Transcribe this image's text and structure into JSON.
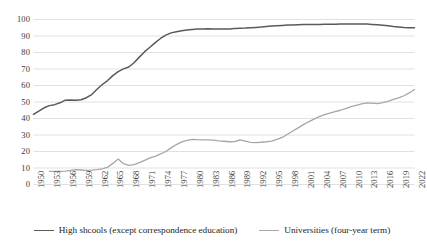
{
  "chart_data": {
    "type": "line",
    "title": "",
    "subtitle": "",
    "xlabel": "",
    "ylabel": "",
    "ylim": [
      0,
      100
    ],
    "ytick_step": 10,
    "yticks": [
      100,
      90,
      80,
      70,
      60,
      50,
      40,
      30,
      20,
      10,
      0
    ],
    "xlim": [
      1950,
      2022
    ],
    "grid": "horizontal",
    "legend_position": "bottom",
    "xtick_labels": [
      "1950",
      "1953",
      "1956",
      "1959",
      "1962",
      "1965",
      "1968",
      "1971",
      "1974",
      "1977",
      "1980",
      "1983",
      "1986",
      "1989",
      "1992",
      "1995",
      "1998",
      "2001",
      "2004",
      "2007",
      "2010",
      "2013",
      "2016",
      "2019",
      "2022"
    ],
    "x": [
      1950,
      1951,
      1952,
      1953,
      1954,
      1955,
      1956,
      1957,
      1958,
      1959,
      1960,
      1961,
      1962,
      1963,
      1964,
      1965,
      1966,
      1967,
      1968,
      1969,
      1970,
      1971,
      1972,
      1973,
      1974,
      1975,
      1976,
      1977,
      1978,
      1979,
      1980,
      1981,
      1982,
      1983,
      1984,
      1985,
      1986,
      1987,
      1988,
      1989,
      1990,
      1991,
      1992,
      1993,
      1994,
      1995,
      1996,
      1997,
      1998,
      1999,
      2000,
      2001,
      2002,
      2003,
      2004,
      2005,
      2006,
      2007,
      2008,
      2009,
      2010,
      2011,
      2012,
      2013,
      2014,
      2015,
      2016,
      2017,
      2018,
      2019,
      2020,
      2021,
      2022
    ],
    "series": [
      {
        "name": "High shcools (except correspondence education)",
        "color": "#5a5a5a",
        "values": [
          42.5,
          44.5,
          46.5,
          47.8,
          48.4,
          49.5,
          51.1,
          51.2,
          51.0,
          51.4,
          52.6,
          54.5,
          57.7,
          60.6,
          63.0,
          66.0,
          68.4,
          70.1,
          71.2,
          73.8,
          77.2,
          80.5,
          83.2,
          86.0,
          88.5,
          90.5,
          91.9,
          92.6,
          93.2,
          93.7,
          94.0,
          94.2,
          94.3,
          94.4,
          94.3,
          94.2,
          94.2,
          94.3,
          94.5,
          94.7,
          94.8,
          95.0,
          95.2,
          95.4,
          95.8,
          96.0,
          96.2,
          96.4,
          96.6,
          96.7,
          96.8,
          96.9,
          96.9,
          97.0,
          97.0,
          97.1,
          97.1,
          97.1,
          97.2,
          97.2,
          97.3,
          97.3,
          97.3,
          97.2,
          97.0,
          96.8,
          96.5,
          96.2,
          95.8,
          95.5,
          95.2,
          95.0,
          95.0
        ]
      },
      {
        "name": "Universities (four-year term)",
        "color": "#a6a6a6",
        "values": [
          null,
          null,
          null,
          8.0,
          8.0,
          8.0,
          8.1,
          8.5,
          9.0,
          8.8,
          8.6,
          8.7,
          9.0,
          9.5,
          10.5,
          12.8,
          15.4,
          12.6,
          11.6,
          12.1,
          13.3,
          14.6,
          16.1,
          17.1,
          18.5,
          20.0,
          22.2,
          24.2,
          25.8,
          26.7,
          27.4,
          27.2,
          27.1,
          27.0,
          26.9,
          26.5,
          26.2,
          25.9,
          26.0,
          27.0,
          26.3,
          25.5,
          25.4,
          25.6,
          25.9,
          26.3,
          27.3,
          28.5,
          30.5,
          32.4,
          34.3,
          36.3,
          38.0,
          39.6,
          41.1,
          42.3,
          43.3,
          44.2,
          45.0,
          46.0,
          47.2,
          48.0,
          48.8,
          49.5,
          49.3,
          49.0,
          49.6,
          50.4,
          51.6,
          52.5,
          53.8,
          55.5,
          57.6
        ]
      }
    ]
  },
  "legend": {
    "items": [
      {
        "label": "High shcools (except correspondence education)",
        "color": "#5a5a5a"
      },
      {
        "label": "Universities (four-year term)",
        "color": "#a6a6a6"
      }
    ]
  }
}
